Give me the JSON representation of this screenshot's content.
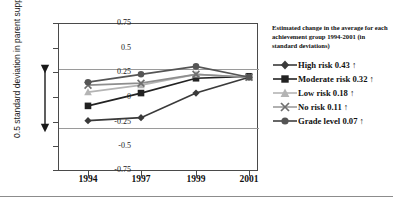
{
  "axis": {
    "y_title": "0.5 standard deviation in parent support",
    "y_ticks": [
      "0.75",
      "0.5",
      "0.25",
      "0",
      "-0.25",
      "-0.5",
      "-0.75"
    ],
    "x_ticks": [
      "1994",
      "1997",
      "1999",
      "2001"
    ]
  },
  "legend": {
    "header": "Estimated change in the average for each achievement group 1994-2001 (in standard deviations)",
    "items": [
      {
        "label": "High risk 0.43 ↑",
        "marker": "diamond-marker",
        "color": "#3a3a3a"
      },
      {
        "label": "Moderate risk 0.32 ↑",
        "marker": "square-marker",
        "color": "#222222"
      },
      {
        "label": "Low risk 0.18 ↑",
        "marker": "triangle-marker",
        "color": "#b4b4b4"
      },
      {
        "label": "No risk 0.11 ↑",
        "marker": "cross-marker",
        "color": "#8e8e8e"
      },
      {
        "label": "Grade level 0.07 ↑",
        "marker": "circle-marker",
        "color": "#555555"
      }
    ]
  },
  "annotation": {
    "sd_range_arrow": "0.5 SD span from +0.20 to -0.20"
  },
  "chart_data": {
    "type": "line",
    "title": "",
    "subtitle": "",
    "xlabel": "",
    "ylabel": "0.5 standard deviation in parent support",
    "x": [
      "1994",
      "1997",
      "1999",
      "2001"
    ],
    "ylim": [
      -0.75,
      0.75
    ],
    "yticks": [
      0.75,
      0.5,
      0.25,
      0,
      -0.25,
      -0.5,
      -0.75
    ],
    "grid": true,
    "gridlines_at": [
      0.2,
      -0.2
    ],
    "legend_position": "right",
    "series": [
      {
        "name": "High risk",
        "change_1994_2001": 0.43,
        "direction": "up",
        "marker": "diamond",
        "color": "#3a3a3a",
        "values": [
          -0.24,
          -0.21,
          0.04,
          0.2
        ]
      },
      {
        "name": "Moderate risk",
        "change_1994_2001": 0.32,
        "direction": "up",
        "marker": "square",
        "color": "#222222",
        "values": [
          -0.09,
          0.04,
          0.19,
          0.21
        ]
      },
      {
        "name": "Low risk",
        "change_1994_2001": 0.18,
        "direction": "up",
        "marker": "triangle",
        "color": "#b4b4b4",
        "values": [
          0.05,
          0.12,
          0.23,
          0.2
        ]
      },
      {
        "name": "No risk",
        "change_1994_2001": 0.11,
        "direction": "up",
        "marker": "cross",
        "color": "#8e8e8e",
        "values": [
          0.12,
          0.14,
          0.23,
          0.2
        ]
      },
      {
        "name": "Grade level",
        "change_1994_2001": 0.07,
        "direction": "up",
        "marker": "circle",
        "color": "#555555",
        "values": [
          0.15,
          0.23,
          0.31,
          0.2
        ]
      }
    ],
    "annotations": [
      {
        "text": "Estimated change in the average for each achievement group 1994-2001 (in standard deviations)",
        "position": "legend-header"
      }
    ]
  }
}
